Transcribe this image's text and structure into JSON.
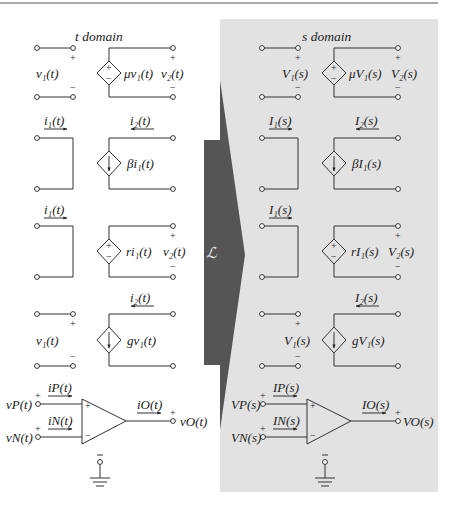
{
  "colors": {
    "background": "#ffffff",
    "s_panel": "#e2e2e2",
    "arrow": "#555555",
    "wire": "#333333",
    "rule": "#555555"
  },
  "transform": {
    "symbol": "ℒ",
    "icon": "laplace-transform-arrow"
  },
  "t_domain": {
    "title": "t domain",
    "vcvs": {
      "v_in": "v₁(t)",
      "gain": "μv₁(t)",
      "v_out": "v₂(t)",
      "plus": "+",
      "minus": "−"
    },
    "cccs": {
      "i_in": "i₁(t)",
      "i_out": "i₂(t)",
      "gain": "βi₁(t)"
    },
    "ccvs": {
      "i_in": "i₁(t)",
      "gain": "ri₁(t)",
      "v_out": "v₂(t)",
      "plus": "+",
      "minus": "−"
    },
    "vccs": {
      "i_out": "i₂(t)",
      "v_in": "v₁(t)",
      "gain": "gv₁(t)",
      "plus": "+",
      "minus": "−"
    },
    "opamp": {
      "vp": "vP(t)",
      "vn": "vN(t)",
      "ip": "iP(t)",
      "in": "iN(t)",
      "io": "iO(t)",
      "vo": "vO(t)",
      "plus": "+",
      "minus": "−"
    }
  },
  "s_domain": {
    "title": "s domain",
    "vcvs": {
      "v_in": "V₁(s)",
      "gain": "μV₁(s)",
      "v_out": "V₂(s)",
      "plus": "+",
      "minus": "−"
    },
    "cccs": {
      "i_in": "I₁(s)",
      "i_out": "I₂(s)",
      "gain": "βI₁(s)"
    },
    "ccvs": {
      "i_in": "I₁(s)",
      "gain": "rI₁(s)",
      "v_out": "V₂(s)",
      "plus": "+",
      "minus": "−"
    },
    "vccs": {
      "i_out": "I₂(s)",
      "v_in": "V₁(s)",
      "gain": "gV₁(s)",
      "plus": "+",
      "minus": "−"
    },
    "opamp": {
      "vp": "VP(s)",
      "vn": "VN(s)",
      "ip": "IP(s)",
      "in": "IN(s)",
      "io": "IO(s)",
      "vo": "VO(s)",
      "plus": "+",
      "minus": "−"
    }
  }
}
